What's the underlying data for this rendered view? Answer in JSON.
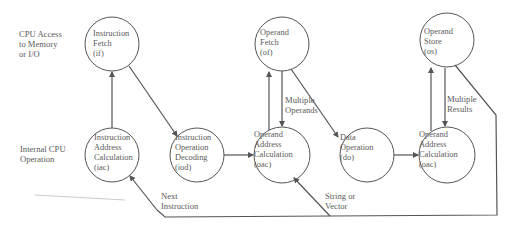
{
  "row_labels": {
    "top": "CPU Access\nto Memory\nor I/O",
    "bottom": "Internal CPU\nOperation"
  },
  "nodes": [
    {
      "id": "if",
      "label": "Instruction\nFetch\n(if)"
    },
    {
      "id": "iac",
      "label": "Instruction\nAddress\nCalculation\n(iac)"
    },
    {
      "id": "iod",
      "label": "Instruction\nOperation\nDecoding\n(iod)"
    },
    {
      "id": "of",
      "label": "Operand\nFetch\n(of)"
    },
    {
      "id": "oac1",
      "label": "Operand\nAddress\nCalculation\n(oac)"
    },
    {
      "id": "do",
      "label": "Data\nOperation\n(do)"
    },
    {
      "id": "os",
      "label": "Operand\nStore\n(os)"
    },
    {
      "id": "oac2",
      "label": "Operand\nAddress\nCalculation\n(oac)"
    }
  ],
  "edge_labels": {
    "multiple_operands": "Multiple\nOperands",
    "multiple_results": "Multiple\nResults",
    "next_instruction": "Next\nInstruction",
    "string_or_vector": "String or\nVector"
  },
  "colors": {
    "stroke": "#555555",
    "text": "#5a5a5a"
  }
}
